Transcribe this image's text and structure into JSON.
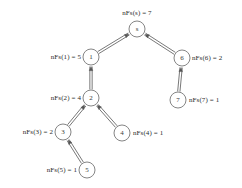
{
  "diagram": {
    "type": "tree-graph",
    "title": "",
    "canvas": {
      "width": 242,
      "height": 188,
      "background": "#ffffff"
    },
    "style": {
      "edge_color": "#555555",
      "node_stroke": "#777777",
      "node_fill": "#ffffff",
      "text_color": "#2b2b2b",
      "edge_rendering": "double-line-with-arrowhead",
      "arrow_direction": "child-to-parent"
    },
    "nodes": [
      {
        "id": "s",
        "node_label": "s",
        "cx": 137,
        "cy": 29,
        "r": 8,
        "annotation": "nFs(s) = 7",
        "annotation_x": 137,
        "annotation_y": 13,
        "annotation_align": "center"
      },
      {
        "id": "1",
        "node_label": "1",
        "cx": 91,
        "cy": 57,
        "r": 8,
        "annotation": "nFs(1) = 5",
        "annotation_x": 81,
        "annotation_y": 57,
        "annotation_align": "right"
      },
      {
        "id": "6",
        "node_label": "6",
        "cx": 182,
        "cy": 58,
        "r": 8,
        "annotation": "nFs(6) = 2",
        "annotation_x": 192,
        "annotation_y": 58,
        "annotation_align": "left"
      },
      {
        "id": "2",
        "node_label": "2",
        "cx": 91,
        "cy": 98,
        "r": 8,
        "annotation": "nFs(2) = 4",
        "annotation_x": 81,
        "annotation_y": 98,
        "annotation_align": "right"
      },
      {
        "id": "7",
        "node_label": "7",
        "cx": 178,
        "cy": 100,
        "r": 8,
        "annotation": "nFs(7) = 1",
        "annotation_x": 189,
        "annotation_y": 100,
        "annotation_align": "left"
      },
      {
        "id": "3",
        "node_label": "3",
        "cx": 63,
        "cy": 132,
        "r": 8,
        "annotation": "nFs(3) = 2",
        "annotation_x": 53,
        "annotation_y": 132,
        "annotation_align": "right"
      },
      {
        "id": "4",
        "node_label": "4",
        "cx": 122,
        "cy": 133,
        "r": 8,
        "annotation": "nFs(4) = 1",
        "annotation_x": 133,
        "annotation_y": 133,
        "annotation_align": "left"
      },
      {
        "id": "5",
        "node_label": "5",
        "cx": 87,
        "cy": 170,
        "r": 8,
        "annotation": "nFs(5) = 1",
        "annotation_x": 77,
        "annotation_y": 170,
        "annotation_align": "right"
      }
    ],
    "edges": [
      {
        "from": "1",
        "to": "s"
      },
      {
        "from": "6",
        "to": "s"
      },
      {
        "from": "2",
        "to": "1"
      },
      {
        "from": "7",
        "to": "6"
      },
      {
        "from": "3",
        "to": "2"
      },
      {
        "from": "4",
        "to": "2"
      },
      {
        "from": "5",
        "to": "3"
      }
    ]
  }
}
